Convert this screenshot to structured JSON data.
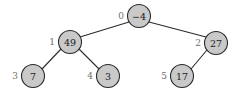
{
  "diagram": {
    "type": "binary-tree",
    "title": "",
    "style": {
      "node_fill": "#c9c9c9",
      "node_stroke": "#2b2b2b",
      "edge_color": "#2b2b2b",
      "value_text_color": "#1a1a1a",
      "index_text_color": "#6e6e6e",
      "background": "#ffffff",
      "node_radius": 11.5
    },
    "nodes": [
      {
        "id": "n0",
        "index": "0",
        "value": "−4",
        "cx": 139,
        "cy": 16,
        "index_x": 124,
        "index_y": 16
      },
      {
        "id": "n1",
        "index": "1",
        "value": "49",
        "cx": 70,
        "cy": 42,
        "index_x": 55,
        "index_y": 42
      },
      {
        "id": "n2",
        "index": "2",
        "value": "27",
        "cx": 216,
        "cy": 43,
        "index_x": 201,
        "index_y": 43
      },
      {
        "id": "n3",
        "index": "3",
        "value": "7",
        "cx": 33,
        "cy": 76,
        "index_x": 18,
        "index_y": 76
      },
      {
        "id": "n4",
        "index": "4",
        "value": "3",
        "cx": 108,
        "cy": 76,
        "index_x": 93,
        "index_y": 76
      },
      {
        "id": "n5",
        "index": "5",
        "value": "17",
        "cx": 182,
        "cy": 76,
        "index_x": 167,
        "index_y": 76
      }
    ],
    "edges": [
      {
        "id": "e0",
        "from": "n0",
        "to": "n1",
        "x1": 129,
        "y1": 22,
        "x2": 80,
        "y2": 37
      },
      {
        "id": "e1",
        "from": "n0",
        "to": "n2",
        "x1": 149,
        "y1": 22,
        "x2": 206,
        "y2": 37
      },
      {
        "id": "e2",
        "from": "n1",
        "to": "n3",
        "x1": 61,
        "y1": 49,
        "x2": 42,
        "y2": 69
      },
      {
        "id": "e3",
        "from": "n1",
        "to": "n4",
        "x1": 79,
        "y1": 49,
        "x2": 99,
        "y2": 69
      },
      {
        "id": "e4",
        "from": "n2",
        "to": "n5",
        "x1": 207,
        "y1": 50,
        "x2": 191,
        "y2": 69
      }
    ]
  }
}
